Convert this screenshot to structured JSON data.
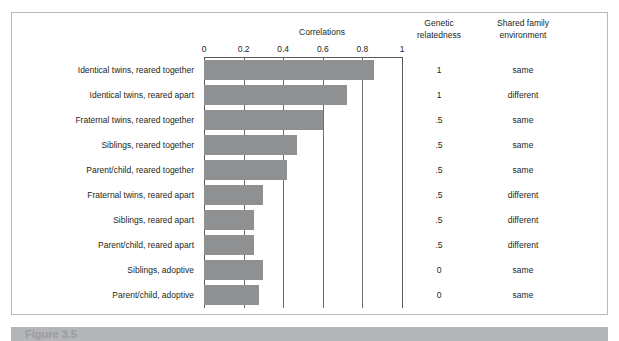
{
  "figure": {
    "clipped_top_text": "",
    "caption": "Figure 3.5"
  },
  "headers": {
    "correlations": "Correlations",
    "genetic_relatedness": "Genetic\nrelatedness",
    "genetic_relatedness_line1": "Genetic",
    "genetic_relatedness_line2": "relatedness",
    "shared_family_environment_line1": "Shared family",
    "shared_family_environment_line2": "environment"
  },
  "chart_data": {
    "type": "bar",
    "orientation": "horizontal",
    "title": "Correlations",
    "xlabel": "Correlations",
    "ylabel": "",
    "xlim": [
      0,
      1
    ],
    "tick_labels": [
      "0",
      "0.2",
      "0.4",
      "0.6",
      "0.8",
      "1"
    ],
    "tick_values": [
      0,
      0.2,
      0.4,
      0.6,
      0.8,
      1
    ],
    "grid": true,
    "grid_axis": "x",
    "legend": "none",
    "bar_color": "#8f9091",
    "categories": [
      "Identical twins, reared together",
      "Identical twins, reared apart",
      "Fraternal twins, reared together",
      "Siblings, reared together",
      "Parent/child, reared together",
      "Fraternal twins, reared apart",
      "Siblings, reared apart",
      "Parent/child, reared apart",
      "Siblings, adoptive",
      "Parent/child, adoptive"
    ],
    "values": [
      0.86,
      0.72,
      0.6,
      0.47,
      0.42,
      0.3,
      0.25,
      0.25,
      0.3,
      0.28
    ],
    "extra_columns": [
      {
        "name": "Genetic relatedness",
        "values": [
          "1",
          "1",
          ".5",
          ".5",
          ".5",
          ".5",
          ".5",
          ".5",
          "0",
          "0"
        ]
      },
      {
        "name": "Shared family environment",
        "values": [
          "same",
          "different",
          "same",
          "same",
          "same",
          "different",
          "different",
          "different",
          "same",
          "same"
        ]
      }
    ]
  }
}
